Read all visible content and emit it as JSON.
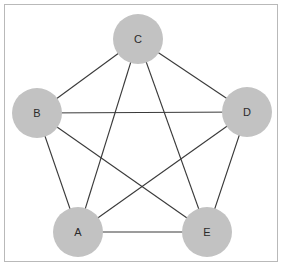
{
  "figure": {
    "title": "",
    "type": "graph-diagram",
    "background_color": "#ffffff",
    "frame": {
      "border_color": "#b9b9b9",
      "x": 4,
      "y": 4,
      "width": 274,
      "height": 258
    }
  },
  "style": {
    "node_fill": "#c2c2c2",
    "node_radius": 25,
    "label_color": "#2b2b2b",
    "edge_color": "#3a3a3a",
    "edge_width": 1.1
  },
  "graph_data": {
    "type": "graph",
    "node_count": 5,
    "edge_count": 10,
    "directed": false,
    "nodes": [
      {
        "id": "A",
        "label": "A",
        "cx": 78,
        "cy": 232,
        "r": 25
      },
      {
        "id": "B",
        "label": "B",
        "cx": 37,
        "cy": 113,
        "r": 25
      },
      {
        "id": "C",
        "label": "C",
        "cx": 138,
        "cy": 39,
        "r": 25
      },
      {
        "id": "D",
        "label": "D",
        "cx": 247,
        "cy": 112,
        "r": 25
      },
      {
        "id": "E",
        "label": "E",
        "cx": 207,
        "cy": 232,
        "r": 25
      }
    ],
    "edges": [
      {
        "from": "A",
        "to": "B"
      },
      {
        "from": "A",
        "to": "C"
      },
      {
        "from": "A",
        "to": "D"
      },
      {
        "from": "A",
        "to": "E"
      },
      {
        "from": "B",
        "to": "C"
      },
      {
        "from": "B",
        "to": "D"
      },
      {
        "from": "B",
        "to": "E"
      },
      {
        "from": "C",
        "to": "D"
      },
      {
        "from": "C",
        "to": "E"
      },
      {
        "from": "D",
        "to": "E"
      }
    ]
  }
}
